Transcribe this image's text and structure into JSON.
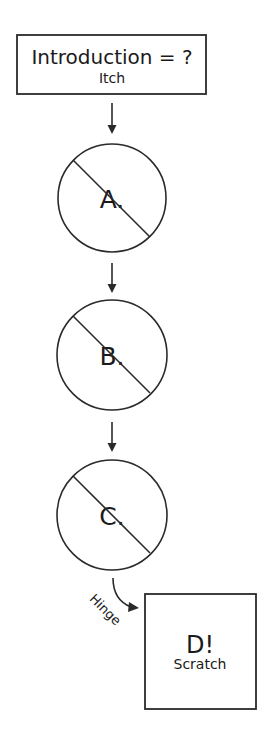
{
  "diagram": {
    "start_node": {
      "title": "Introduction = ?",
      "subtitle": "Itch"
    },
    "steps": [
      {
        "label": "A.",
        "state": "crossed-out"
      },
      {
        "label": "B.",
        "state": "crossed-out"
      },
      {
        "label": "C.",
        "state": "crossed-out"
      }
    ],
    "edge_label": "Hinge",
    "end_node": {
      "title": "D!",
      "subtitle": "Scratch"
    }
  }
}
